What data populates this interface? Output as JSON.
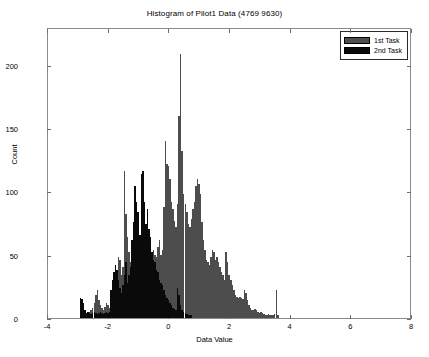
{
  "chart_data": {
    "type": "bar",
    "title": "Histogram of Pilot1 Data (4769 9630)",
    "xlabel": "Data Value",
    "ylabel": "Count",
    "xlim": [
      -4,
      8
    ],
    "ylim": [
      0,
      230
    ],
    "xticks": [
      -4,
      -2,
      0,
      2,
      4,
      6,
      8
    ],
    "yticks": [
      0,
      50,
      100,
      150,
      200
    ],
    "grid": false,
    "legend_position": "top-right",
    "bin_width": 0.05,
    "series": [
      {
        "name": "1st Task",
        "color": "#4d4d4d",
        "x": [
          -2.95,
          -2.9,
          -2.85,
          -2.8,
          -2.75,
          -2.7,
          -2.65,
          -2.6,
          -2.55,
          -2.5,
          -2.45,
          -2.4,
          -2.35,
          -2.3,
          -2.25,
          -2.2,
          -2.15,
          -2.1,
          -2.05,
          -2.0,
          -1.95,
          -1.9,
          -1.85,
          -1.8,
          -1.75,
          -1.7,
          -1.65,
          -1.6,
          -1.55,
          -1.5,
          -1.45,
          -1.4,
          -1.35,
          -1.3,
          -1.25,
          -1.2,
          -1.15,
          -1.1,
          -1.05,
          -1.0,
          -0.95,
          -0.9,
          -0.85,
          -0.8,
          -0.75,
          -0.7,
          -0.65,
          -0.6,
          -0.55,
          -0.5,
          -0.45,
          -0.4,
          -0.35,
          -0.3,
          -0.25,
          -0.2,
          -0.15,
          -0.1,
          -0.05,
          0.0,
          0.05,
          0.1,
          0.15,
          0.2,
          0.25,
          0.3,
          0.35,
          0.4,
          0.45,
          0.5,
          0.55,
          0.6,
          0.65,
          0.7,
          0.75,
          0.8,
          0.85,
          0.9,
          0.95,
          1.0,
          1.05,
          1.1,
          1.15,
          1.2,
          1.25,
          1.3,
          1.35,
          1.4,
          1.45,
          1.5,
          1.55,
          1.6,
          1.65,
          1.7,
          1.75,
          1.8,
          1.85,
          1.9,
          1.95,
          2.0,
          2.05,
          2.1,
          2.15,
          2.2,
          2.25,
          2.3,
          2.35,
          2.4,
          2.45,
          2.5,
          2.55,
          2.6,
          2.65,
          2.7,
          2.75,
          2.8,
          2.85,
          2.9,
          2.95,
          3.0,
          3.05,
          3.1,
          3.15,
          3.2,
          3.25,
          3.3,
          3.35,
          3.4,
          3.45,
          3.5,
          3.55
        ],
        "values": [
          0,
          2,
          3,
          2,
          4,
          3,
          5,
          6,
          8,
          12,
          18,
          22,
          14,
          10,
          8,
          6,
          9,
          12,
          10,
          8,
          12,
          18,
          24,
          30,
          36,
          48,
          46,
          34,
          40,
          116,
          82,
          64,
          52,
          44,
          48,
          40,
          36,
          42,
          38,
          44,
          40,
          46,
          42,
          50,
          48,
          44,
          52,
          46,
          54,
          50,
          48,
          56,
          62,
          50,
          54,
          88,
          140,
          122,
          120,
          110,
          92,
          86,
          77,
          72,
          90,
          160,
          209,
          132,
          98,
          90,
          84,
          74,
          72,
          78,
          86,
          92,
          104,
          110,
          106,
          98,
          76,
          62,
          54,
          46,
          44,
          42,
          48,
          54,
          52,
          46,
          48,
          44,
          40,
          36,
          34,
          30,
          52,
          44,
          34,
          30,
          26,
          22,
          18,
          17,
          16,
          17,
          16,
          15,
          22,
          20,
          14,
          10,
          8,
          6,
          6,
          7,
          6,
          5,
          4,
          5,
          4,
          3,
          2,
          2,
          3,
          2,
          2,
          2,
          3,
          22,
          2
        ]
      },
      {
        "name": "2nd Task",
        "color": "#0a0a0a",
        "x": [
          -2.95,
          -2.9,
          -2.85,
          -2.8,
          -2.75,
          -2.7,
          -2.65,
          -2.6,
          -2.55,
          -2.5,
          -2.45,
          -2.4,
          -2.35,
          -2.3,
          -2.25,
          -2.2,
          -2.15,
          -2.1,
          -2.05,
          -2.0,
          -1.95,
          -1.9,
          -1.85,
          -1.8,
          -1.75,
          -1.7,
          -1.65,
          -1.6,
          -1.55,
          -1.5,
          -1.45,
          -1.4,
          -1.35,
          -1.3,
          -1.25,
          -1.2,
          -1.15,
          -1.1,
          -1.05,
          -1.0,
          -0.95,
          -0.9,
          -0.85,
          -0.8,
          -0.75,
          -0.7,
          -0.65,
          -0.6,
          -0.55,
          -0.5,
          -0.45,
          -0.4,
          -0.35,
          -0.3,
          -0.25,
          -0.2,
          -0.15,
          -0.1,
          -0.05,
          0.0,
          0.05,
          0.1,
          0.15,
          0.2,
          0.25,
          0.3,
          0.35,
          0.4,
          0.45,
          0.5,
          0.55,
          0.6,
          0.65,
          0.7
        ],
        "values": [
          16,
          15,
          12,
          6,
          4,
          5,
          4,
          3,
          4,
          5,
          4,
          3,
          4,
          5,
          4,
          3,
          4,
          5,
          4,
          5,
          22,
          30,
          36,
          42,
          38,
          30,
          24,
          20,
          26,
          34,
          44,
          28,
          34,
          40,
          62,
          76,
          104,
          92,
          84,
          66,
          114,
          116,
          92,
          74,
          86,
          70,
          64,
          52,
          46,
          44,
          38,
          36,
          30,
          28,
          26,
          22,
          18,
          16,
          14,
          12,
          10,
          8,
          7,
          6,
          24,
          18,
          10,
          6,
          5,
          4,
          3,
          2,
          2,
          2
        ]
      }
    ]
  },
  "legend": {
    "entries": [
      {
        "label": "1st Task",
        "color": "#4d4d4d"
      },
      {
        "label": "2nd Task",
        "color": "#0a0a0a"
      }
    ]
  }
}
